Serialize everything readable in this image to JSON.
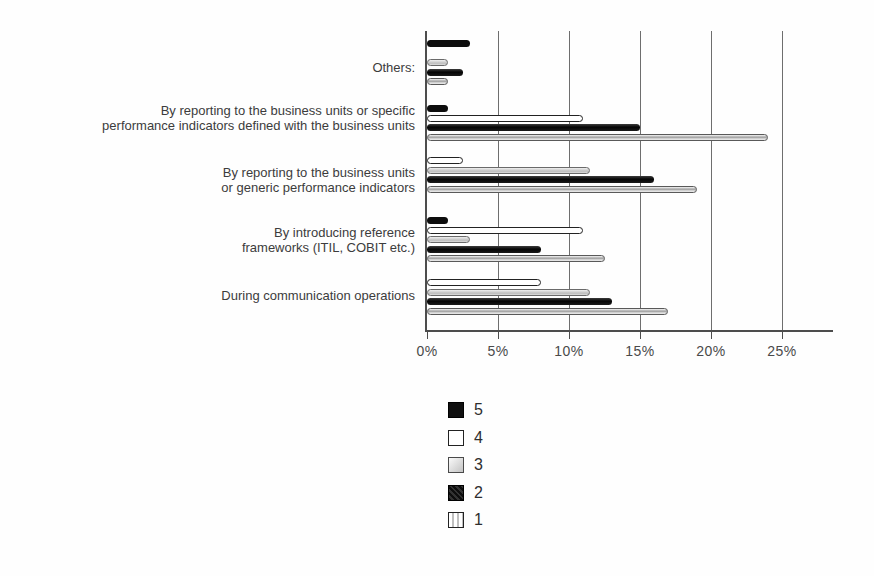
{
  "chart_data": {
    "type": "bar",
    "orientation": "horizontal",
    "title": "",
    "xlabel": "",
    "ylabel": "",
    "unit": "%",
    "x_ticks": [
      "0%",
      "5%",
      "10%",
      "15%",
      "20%",
      "25%"
    ],
    "x_range": [
      0,
      28.5
    ],
    "grid": "vertical gridlines every 5%",
    "legend_position": "below chart, center-left",
    "series_legend": [
      {
        "id": "5",
        "label": "5",
        "swatch": "solid-black"
      },
      {
        "id": "4",
        "label": "4",
        "swatch": "white-outlined"
      },
      {
        "id": "3",
        "label": "3",
        "swatch": "light-gray-gradient"
      },
      {
        "id": "2",
        "label": "2",
        "swatch": "dark-textured"
      },
      {
        "id": "1",
        "label": "1",
        "swatch": "striped-light"
      }
    ],
    "groups": [
      {
        "label_lines": [
          "Others:"
        ],
        "bars": [
          {
            "series": "5",
            "value": 3
          },
          {
            "series": "4",
            "value": 0
          },
          {
            "series": "3",
            "value": 1.5
          },
          {
            "series": "2",
            "value": 2.5
          },
          {
            "series": "1",
            "value": 1.5
          }
        ]
      },
      {
        "label_lines": [
          "By reporting to the business units or specific",
          "performance indicators defined with the business units"
        ],
        "bars": [
          {
            "series": "5",
            "value": 1.5
          },
          {
            "series": "4",
            "value": 11
          },
          {
            "series": "2",
            "value": 15
          },
          {
            "series": "1",
            "value": 24
          }
        ]
      },
      {
        "label_lines": [
          "By reporting to the business units",
          "or generic performance indicators"
        ],
        "bars": [
          {
            "series": "4",
            "value": 2.5
          },
          {
            "series": "3",
            "value": 11.5
          },
          {
            "series": "2",
            "value": 16
          },
          {
            "series": "1",
            "value": 19
          }
        ]
      },
      {
        "label_lines": [
          "By introducing reference",
          "frameworks (ITIL, COBIT etc.)"
        ],
        "bars": [
          {
            "series": "5",
            "value": 1.5
          },
          {
            "series": "4",
            "value": 11
          },
          {
            "series": "3",
            "value": 3
          },
          {
            "series": "2",
            "value": 8
          },
          {
            "series": "1",
            "value": 12.5
          }
        ]
      },
      {
        "label_lines": [
          "During communication operations"
        ],
        "bars": [
          {
            "series": "4",
            "value": 8
          },
          {
            "series": "3",
            "value": 11.5
          },
          {
            "series": "2",
            "value": 13
          },
          {
            "series": "1",
            "value": 17
          }
        ]
      }
    ]
  },
  "colors": {
    "axis": "#4d4d4d",
    "grid": "#6e6e6e",
    "text": "#3c3c3c",
    "series_black": "#0d0d0d"
  }
}
